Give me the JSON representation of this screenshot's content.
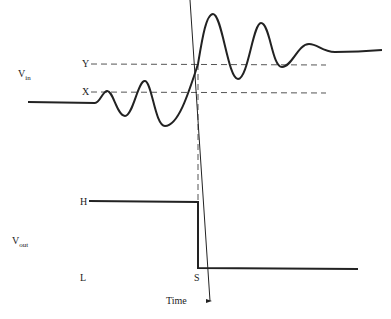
{
  "diagram": {
    "vin_label": "V",
    "vin_sub": "in",
    "vout_label": "V",
    "vout_sub": "out",
    "threshold_upper": "Y",
    "threshold_lower": "X",
    "output_high": "H",
    "output_low": "L",
    "switch_point": "S",
    "time_label": "Time",
    "colors": {
      "line": "#222222",
      "dash": "#555555",
      "background": "#ffffff"
    }
  }
}
